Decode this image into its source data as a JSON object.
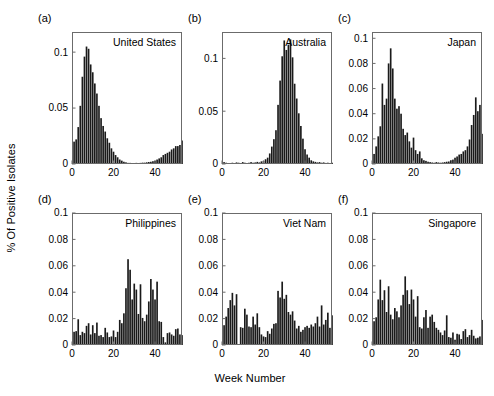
{
  "figure": {
    "ylabel": "% Of Positive Isolates",
    "xlabel": "Week Number",
    "bar_color": "#1a1a1a",
    "axis_color": "#6b6b6b"
  },
  "panel_tags": [
    "(a)",
    "(b)",
    "(c)",
    "(d)",
    "(e)",
    "(f)"
  ],
  "chart_data": [
    {
      "type": "bar",
      "tag": "(a)",
      "title": "United States",
      "xlabel": "Week Number",
      "ylabel": "% Of Positive Isolates",
      "xlim": [
        0,
        53
      ],
      "ylim": [
        0,
        0.118
      ],
      "xticks": [
        0,
        20,
        40
      ],
      "yticks": [
        0,
        0.05,
        0.1
      ],
      "ytick_labels": [
        "0",
        "0.05",
        "0.1"
      ],
      "x": [
        1,
        2,
        3,
        4,
        5,
        6,
        7,
        8,
        9,
        10,
        11,
        12,
        13,
        14,
        15,
        16,
        17,
        18,
        19,
        20,
        21,
        22,
        23,
        24,
        25,
        26,
        27,
        28,
        29,
        30,
        31,
        32,
        33,
        34,
        35,
        36,
        37,
        38,
        39,
        40,
        41,
        42,
        43,
        44,
        45,
        46,
        47,
        48,
        49,
        50,
        51,
        52,
        53
      ],
      "values": [
        0.02,
        0.022,
        0.033,
        0.052,
        0.078,
        0.096,
        0.105,
        0.103,
        0.089,
        0.082,
        0.072,
        0.063,
        0.052,
        0.041,
        0.034,
        0.029,
        0.023,
        0.019,
        0.014,
        0.011,
        0.008,
        0.006,
        0.004,
        0.003,
        0.002,
        0.0015,
        0.001,
        0.001,
        0.0008,
        0.0008,
        0.001,
        0.0008,
        0.001,
        0.0012,
        0.0012,
        0.0015,
        0.0018,
        0.002,
        0.0025,
        0.003,
        0.004,
        0.005,
        0.006,
        0.008,
        0.009,
        0.01,
        0.011,
        0.013,
        0.014,
        0.016,
        0.016,
        0.017,
        0.021
      ]
    },
    {
      "type": "bar",
      "tag": "(b)",
      "title": "Australia",
      "xlabel": "Week Number",
      "ylabel": "% Of Positive Isolates",
      "xlim": [
        0,
        53
      ],
      "ylim": [
        0,
        0.125
      ],
      "xticks": [
        0,
        20,
        40
      ],
      "yticks": [
        0,
        0.05,
        0.1
      ],
      "ytick_labels": [
        "0",
        "0.05",
        "0.1"
      ],
      "x": [
        1,
        2,
        3,
        4,
        5,
        6,
        7,
        8,
        9,
        10,
        11,
        12,
        13,
        14,
        15,
        16,
        17,
        18,
        19,
        20,
        21,
        22,
        23,
        24,
        25,
        26,
        27,
        28,
        29,
        30,
        31,
        32,
        33,
        34,
        35,
        36,
        37,
        38,
        39,
        40,
        41,
        42,
        43,
        44,
        45,
        46,
        47,
        48,
        49,
        50,
        51,
        52,
        53
      ],
      "values": [
        0.0018,
        0.0012,
        0.0008,
        0.0008,
        0.0012,
        0.0008,
        0.0015,
        0.0012,
        0.0008,
        0.0018,
        0.0012,
        0.0008,
        0.0012,
        0.0018,
        0.0012,
        0.0015,
        0.002,
        0.0015,
        0.0025,
        0.003,
        0.0045,
        0.006,
        0.01,
        0.0165,
        0.0235,
        0.032,
        0.056,
        0.079,
        0.102,
        0.117,
        0.108,
        0.113,
        0.118,
        0.101,
        0.076,
        0.062,
        0.048,
        0.036,
        0.024,
        0.014,
        0.009,
        0.006,
        0.0035,
        0.0025,
        0.002,
        0.0015,
        0.0018,
        0.0012,
        0.0015,
        0.001,
        0.0012,
        0.0008,
        0.0012
      ]
    },
    {
      "type": "bar",
      "tag": "(c)",
      "title": "Japan",
      "xlabel": "Week Number",
      "ylabel": "% Of Positive Isolates",
      "xlim": [
        0,
        53
      ],
      "ylim": [
        0,
        0.105
      ],
      "xticks": [
        0,
        20,
        40
      ],
      "yticks": [
        0,
        0.02,
        0.04,
        0.06,
        0.08,
        0.1
      ],
      "ytick_labels": [
        "0",
        "0.02",
        "0.04",
        "0.06",
        "0.08",
        "0.1"
      ],
      "x": [
        1,
        2,
        3,
        4,
        5,
        6,
        7,
        8,
        9,
        10,
        11,
        12,
        13,
        14,
        15,
        16,
        17,
        18,
        19,
        20,
        21,
        22,
        23,
        24,
        25,
        26,
        27,
        28,
        29,
        30,
        31,
        32,
        33,
        34,
        35,
        36,
        37,
        38,
        39,
        40,
        41,
        42,
        43,
        44,
        45,
        46,
        47,
        48,
        49,
        50,
        51,
        52,
        53
      ],
      "values": [
        0.008,
        0.014,
        0.022,
        0.03,
        0.064,
        0.047,
        0.052,
        0.08,
        0.092,
        0.076,
        0.052,
        0.044,
        0.046,
        0.04,
        0.028,
        0.023,
        0.025,
        0.018,
        0.013,
        0.021,
        0.011,
        0.008,
        0.01,
        0.0045,
        0.003,
        0.0025,
        0.0018,
        0.0015,
        0.0012,
        0.001,
        0.0015,
        0.0012,
        0.001,
        0.0012,
        0.0015,
        0.0018,
        0.002,
        0.003,
        0.0035,
        0.005,
        0.006,
        0.0075,
        0.008,
        0.01,
        0.011,
        0.014,
        0.0195,
        0.031,
        0.039,
        0.053,
        0.042,
        0.047,
        0.024
      ]
    },
    {
      "type": "bar",
      "tag": "(d)",
      "title": "Philippines",
      "xlabel": "Week Number",
      "ylabel": "% Of Positive Isolates",
      "xlim": [
        0,
        53
      ],
      "ylim": [
        0,
        0.1
      ],
      "xticks": [
        0,
        20,
        40
      ],
      "yticks": [
        0,
        0.02,
        0.04,
        0.06,
        0.08,
        0.1
      ],
      "ytick_labels": [
        "0",
        "0.02",
        "0.04",
        "0.06",
        "0.08",
        "0.1"
      ],
      "x": [
        1,
        2,
        3,
        4,
        5,
        6,
        7,
        8,
        9,
        10,
        11,
        12,
        13,
        14,
        15,
        16,
        17,
        18,
        19,
        20,
        21,
        22,
        23,
        24,
        25,
        26,
        27,
        28,
        29,
        30,
        31,
        32,
        33,
        34,
        35,
        36,
        37,
        38,
        39,
        40,
        41,
        42,
        43,
        44,
        45,
        46,
        47,
        48,
        49,
        50,
        51,
        52,
        53
      ],
      "values": [
        0.01,
        0.0105,
        0.0195,
        0.0075,
        0.01,
        0.009,
        0.0145,
        0.0165,
        0.008,
        0.015,
        0.009,
        0.017,
        0.007,
        0.0075,
        0.006,
        0.013,
        0.0095,
        0.006,
        0.0065,
        0.011,
        0.006,
        0.01,
        0.019,
        0.0165,
        0.024,
        0.043,
        0.065,
        0.057,
        0.0345,
        0.0465,
        0.042,
        0.0235,
        0.046,
        0.0205,
        0.018,
        0.023,
        0.033,
        0.05,
        0.042,
        0.0345,
        0.048,
        0.018,
        0.0175,
        0.006,
        0.002,
        0.009,
        0.0095,
        0.008,
        0.007,
        0.012,
        0.0125,
        0.008,
        0.0075
      ]
    },
    {
      "type": "bar",
      "tag": "(e)",
      "title": "Viet Nam",
      "xlabel": "Week Number",
      "ylabel": "% Of Positive Isolates",
      "xlim": [
        0,
        53
      ],
      "ylim": [
        0,
        0.1
      ],
      "xticks": [
        0,
        20,
        40
      ],
      "yticks": [
        0,
        0.02,
        0.04,
        0.06,
        0.08,
        0.1
      ],
      "ytick_labels": [
        "0",
        "0.02",
        "0.04",
        "0.06",
        "0.08",
        "0.1"
      ],
      "x": [
        1,
        2,
        3,
        4,
        5,
        6,
        7,
        8,
        9,
        10,
        11,
        12,
        13,
        14,
        15,
        16,
        17,
        18,
        19,
        20,
        21,
        22,
        23,
        24,
        25,
        26,
        27,
        28,
        29,
        30,
        31,
        32,
        33,
        34,
        35,
        36,
        37,
        38,
        39,
        40,
        41,
        42,
        43,
        44,
        45,
        46,
        47,
        48,
        49,
        50,
        51,
        52,
        53
      ],
      "values": [
        0.015,
        0.0215,
        0.028,
        0.034,
        0.0395,
        0.03,
        0.0385,
        0.0,
        0.0135,
        0.013,
        0.0275,
        0.023,
        0.014,
        0.0135,
        0.0215,
        0.0155,
        0.024,
        0.0135,
        0.008,
        0.0065,
        0.006,
        0.0105,
        0.0085,
        0.0125,
        0.016,
        0.0165,
        0.041,
        0.036,
        0.048,
        0.035,
        0.038,
        0.025,
        0.023,
        0.0255,
        0.0185,
        0.0125,
        0.0145,
        0.01,
        0.0115,
        0.0135,
        0.0145,
        0.013,
        0.0155,
        0.014,
        0.0165,
        0.0215,
        0.014,
        0.03,
        0.0155,
        0.019,
        0.0245,
        0.013,
        0.0225
      ]
    },
    {
      "type": "bar",
      "tag": "(f)",
      "title": "Singapore",
      "xlabel": "Week Number",
      "ylabel": "% Of Positive Isolates",
      "xlim": [
        0,
        53
      ],
      "ylim": [
        0,
        0.1
      ],
      "xticks": [
        0,
        20,
        40
      ],
      "yticks": [
        0,
        0.02,
        0.04,
        0.06,
        0.08,
        0.1
      ],
      "ytick_labels": [
        "0",
        "0.02",
        "0.04",
        "0.06",
        "0.08",
        "0.1"
      ],
      "x": [
        1,
        2,
        3,
        4,
        5,
        6,
        7,
        8,
        9,
        10,
        11,
        12,
        13,
        14,
        15,
        16,
        17,
        18,
        19,
        20,
        21,
        22,
        23,
        24,
        25,
        26,
        27,
        28,
        29,
        30,
        31,
        32,
        33,
        34,
        35,
        36,
        37,
        38,
        39,
        40,
        41,
        42,
        43,
        44,
        45,
        46,
        47,
        48,
        49,
        50,
        51,
        52,
        53
      ],
      "values": [
        0.018,
        0.021,
        0.0345,
        0.0495,
        0.034,
        0.0415,
        0.025,
        0.0445,
        0.023,
        0.0195,
        0.028,
        0.0255,
        0.021,
        0.03,
        0.038,
        0.052,
        0.0415,
        0.031,
        0.042,
        0.0345,
        0.0215,
        0.037,
        0.0135,
        0.0125,
        0.021,
        0.0265,
        0.013,
        0.0215,
        0.023,
        0.0175,
        0.013,
        0.0115,
        0.0095,
        0.0075,
        0.011,
        0.0225,
        0.006,
        0.0055,
        0.0095,
        0.004,
        0.0085,
        0.008,
        0.0045,
        0.0105,
        0.012,
        0.006,
        0.0075,
        0.0115,
        0.007,
        0.005,
        0.0055,
        0.0065,
        0.019
      ]
    }
  ]
}
